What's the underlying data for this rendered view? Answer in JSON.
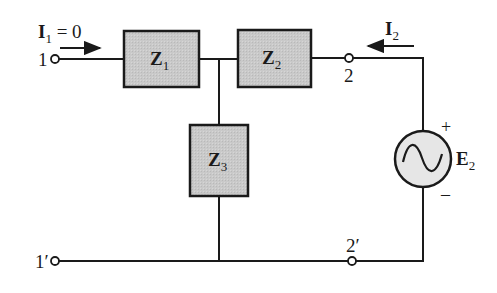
{
  "diagram": {
    "type": "two-port T network with voltage source",
    "colors": {
      "wire": "#1a1a1a",
      "impedance_fill": "#c8c8c8",
      "source_fill": "#e6e6e6",
      "background": "#ffffff"
    },
    "currents": {
      "i1": {
        "symbol": "I",
        "sub": "1",
        "suffix": " = 0",
        "direction": "right"
      },
      "i2": {
        "symbol": "I",
        "sub": "2",
        "direction": "left"
      }
    },
    "terminals": {
      "t1": "1",
      "t1p": "1′",
      "t2": "2",
      "t2p": "2′"
    },
    "impedances": [
      {
        "symbol": "Z",
        "sub": "1"
      },
      {
        "symbol": "Z",
        "sub": "2"
      },
      {
        "symbol": "Z",
        "sub": "3"
      }
    ],
    "source": {
      "symbol": "E",
      "sub": "2",
      "plus": "+",
      "minus": "–",
      "kind": "ac-sine-icon"
    }
  }
}
